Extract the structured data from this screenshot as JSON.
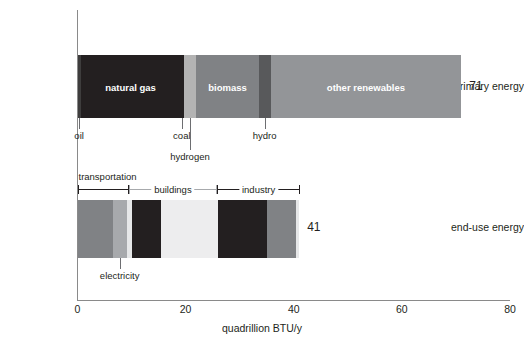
{
  "chart_data": {
    "type": "bar",
    "orientation": "horizontal",
    "title": "",
    "xlabel": "quadrillion BTU/y",
    "ylabel": "",
    "xlim": [
      0,
      80
    ],
    "xticks": [
      0,
      20,
      40,
      60,
      80
    ],
    "xtick_labels": [
      "0",
      "20",
      "40",
      "60",
      "80"
    ],
    "grid": false,
    "legend": "none",
    "categories": [
      "primary energy",
      "end-use energy"
    ],
    "totals": [
      71,
      41
    ],
    "series": [
      {
        "name": "primary energy",
        "total": 71,
        "total_label": "71",
        "segments": [
          {
            "name": "oil",
            "value": 0.6,
            "start": 0.0,
            "label": "",
            "color": "#3e3d3d",
            "label_inside": false
          },
          {
            "name": "natural gas",
            "value": 18.4,
            "start": 0.6,
            "label": "natural gas",
            "color": "#231f20",
            "label_inside": true
          },
          {
            "name": "coal",
            "value": 0.7,
            "start": 19.0,
            "label": "",
            "color": "#231f20",
            "label_inside": false
          },
          {
            "name": "hydrogen",
            "value": 2.3,
            "start": 19.7,
            "label": "",
            "color": "#b3b3b3",
            "label_inside": false
          },
          {
            "name": "biomass",
            "value": 11.5,
            "start": 22.0,
            "label": "biomass",
            "color": "#808285",
            "label_inside": true
          },
          {
            "name": "hydro",
            "value": 2.2,
            "start": 33.5,
            "label": "",
            "color": "#58595b",
            "label_inside": false
          },
          {
            "name": "other renewables",
            "value": 35.3,
            "start": 35.7,
            "label": "other renewables",
            "color": "#939598",
            "label_inside": true
          }
        ]
      },
      {
        "name": "end-use energy",
        "total": 41,
        "total_label": "41",
        "segments": [
          {
            "name": "transportation-fuel",
            "value": 6.5,
            "start": 0.0,
            "label": "",
            "color": "#808285",
            "label_inside": false
          },
          {
            "name": "transportation-electric",
            "value": 2.6,
            "start": 6.5,
            "label": "",
            "color": "#a7a9ac",
            "label_inside": false
          },
          {
            "name": "buildings-fuel",
            "value": 0.9,
            "start": 9.1,
            "label": "",
            "color": "#e6e7e8",
            "label_inside": false
          },
          {
            "name": "buildings-dark",
            "value": 5.4,
            "start": 10.0,
            "label": "",
            "color": "#231f20",
            "label_inside": false
          },
          {
            "name": "buildings-electric",
            "value": 10.6,
            "start": 15.4,
            "label": "",
            "color": "#ededee",
            "label_inside": false
          },
          {
            "name": "industry-fuel",
            "value": 8.4,
            "start": 26.0,
            "label": "",
            "color": "#231f20",
            "label_inside": false
          },
          {
            "name": "industry-divider",
            "value": 0.6,
            "start": 34.4,
            "label": "",
            "color": "#231f20",
            "label_inside": false
          },
          {
            "name": "industry-electric",
            "value": 5.5,
            "start": 35.0,
            "label": "",
            "color": "#808285",
            "label_inside": false
          },
          {
            "name": "industry-tail",
            "value": 0.5,
            "start": 40.5,
            "label": "",
            "color": "#e6e7e8",
            "label_inside": false
          }
        ]
      }
    ],
    "callouts": [
      {
        "text": "oil",
        "value": 0.3,
        "row": "primary",
        "level": 1
      },
      {
        "text": "coal",
        "value": 19.3,
        "row": "primary",
        "level": 1
      },
      {
        "text": "hydrogen",
        "value": 20.8,
        "row": "primary",
        "level": 2
      },
      {
        "text": "hydro",
        "value": 34.6,
        "row": "primary",
        "level": 1
      },
      {
        "text": "electricity",
        "value": 7.8,
        "row": "enduse",
        "level": 1
      }
    ],
    "brackets": [
      {
        "text": "transportation",
        "start": 0.0,
        "end": 9.5,
        "style": "dark",
        "heading_above": true
      },
      {
        "text": "buildings",
        "start": 9.5,
        "end": 25.8,
        "style": "grey",
        "heading_above": false
      },
      {
        "text": "industry",
        "start": 25.8,
        "end": 41.2,
        "style": "dark",
        "heading_above": false
      }
    ]
  },
  "axis": {
    "x_title": "quadrillion BTU/y",
    "ticks": [
      "0",
      "20",
      "40",
      "60",
      "80"
    ]
  },
  "rows": {
    "primary_label": "primary energy",
    "enduse_label": "end-use energy"
  }
}
